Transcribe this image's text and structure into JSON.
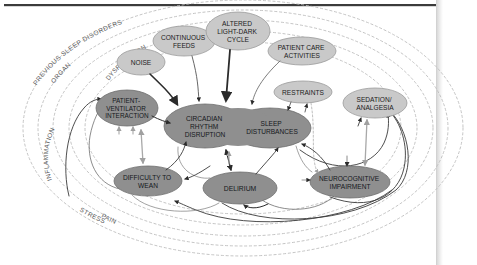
{
  "figure": {
    "type": "causal-loop-diagram",
    "canvas": {
      "width": 477,
      "height": 265
    },
    "colors": {
      "page_background": "#ffffff",
      "top_rule": "#3b3b3b",
      "page_edge": "#e3e3e3",
      "node_light_fill": "#c9c9c9",
      "node_light_stroke": "#9a9a9a",
      "node_dark_fill": "#8f8f8f",
      "node_dark_stroke": "#6f6f6f",
      "arrow_dark": "#2b2b2b",
      "arrow_light": "#a8a8a8",
      "ring_dashed": "#bdbdbd",
      "ring_text": "#5a5a5a",
      "node_text": "#1b1b1b"
    }
  },
  "rings": [
    {
      "id": "ring-previous-sleep-disorders",
      "label": "PREVIOUS SLEEP DISORDERS",
      "index": 0
    },
    {
      "id": "ring-organ-dysfunction",
      "label": "ORGAN     DYSFUNCTION",
      "index": 1
    },
    {
      "id": "ring-inflammation",
      "label": "INFLAMMATION",
      "index": 2
    },
    {
      "id": "ring-stress",
      "label": "STRESS",
      "index": 3
    },
    {
      "id": "ring-pain",
      "label": "PAIN",
      "index": 4
    }
  ],
  "ring_labels": {
    "previous_sleep_disorders": "PREVIOUS SLEEP DISORDERS",
    "organ": "ORGAN",
    "dysfunction": "DYSFUNCTION",
    "inflammation": "INFLAMMATION",
    "stress": "STRESS",
    "pain": "PAIN"
  },
  "nodes": [
    {
      "id": "noise",
      "label": "NOISE",
      "lines": [
        "NOISE"
      ],
      "tone": "light",
      "cx": 141,
      "cy": 62,
      "rx": 24,
      "ry": 13,
      "font_size": 6.6
    },
    {
      "id": "continuous-feeds",
      "label": "CONTINUOUS FEEDS",
      "lines": [
        "CONTINUOUS",
        "FEEDS"
      ],
      "tone": "light",
      "cx": 184,
      "cy": 41,
      "rx": 31,
      "ry": 15,
      "font_size": 6.6
    },
    {
      "id": "altered-light-dark-cycle",
      "label": "ALTERED LIGHT-DARK CYCLE",
      "lines": [
        "ALTERED",
        "LIGHT-DARK",
        "CYCLE"
      ],
      "tone": "light",
      "cx": 238,
      "cy": 31,
      "rx": 32,
      "ry": 19,
      "font_size": 6.6
    },
    {
      "id": "patient-care-activities",
      "label": "PATIENT CARE ACTIVITIES",
      "lines": [
        "PATIENT CARE",
        "ACTIVITIES"
      ],
      "tone": "light",
      "cx": 302,
      "cy": 51,
      "rx": 34,
      "ry": 14,
      "font_size": 6.6
    },
    {
      "id": "restraints",
      "label": "RESTRAINTS",
      "lines": [
        "RESTRAINTS"
      ],
      "tone": "light",
      "cx": 303,
      "cy": 92,
      "rx": 29,
      "ry": 11,
      "font_size": 6.6
    },
    {
      "id": "sedation-analgesia",
      "label": "SEDATION/ ANALGESIA",
      "lines": [
        "SEDATION/",
        "ANALGESIA"
      ],
      "tone": "light",
      "cx": 375,
      "cy": 103,
      "rx": 32,
      "ry": 15,
      "font_size": 6.6
    },
    {
      "id": "patient-ventilator-interaction",
      "label": "PATIENT-VENTILATOR INTERACTION",
      "lines": [
        "PATIENT-",
        "VENTILATOR",
        "INTERACTION"
      ],
      "tone": "dark",
      "cx": 127,
      "cy": 108,
      "rx": 31,
      "ry": 18,
      "font_size": 6.4
    },
    {
      "id": "circadian-rhythm-disruption",
      "label": "CIRCADIAN RHYTHM DISRUPTION",
      "lines": [
        "CIRCADIAN",
        "RHYTHM",
        "DISRUPTION"
      ],
      "tone": "dark",
      "cx": 205,
      "cy": 126,
      "rx": 41,
      "ry": 22,
      "font_size": 6.6
    },
    {
      "id": "sleep-disturbances",
      "label": "SLEEP DISTURBANCES",
      "lines": [
        "SLEEP",
        "DISTURBANCES"
      ],
      "tone": "dark",
      "cx": 270,
      "cy": 128,
      "rx": 41,
      "ry": 20,
      "font_size": 6.6
    },
    {
      "id": "difficulty-to-wean",
      "label": "DIFFICULTY TO WEAN",
      "lines": [
        "DIFFICULTY TO",
        "WEAN"
      ],
      "tone": "dark",
      "cx": 148,
      "cy": 181,
      "rx": 34,
      "ry": 15,
      "font_size": 6.6
    },
    {
      "id": "delirium",
      "label": "DELIRIUM",
      "lines": [
        "DELIRIUM"
      ],
      "tone": "dark",
      "cx": 240,
      "cy": 188,
      "rx": 37,
      "ry": 16,
      "font_size": 6.8
    },
    {
      "id": "neurocognitive-impairment",
      "label": "NEUROCOGNITIVE IMPAIRMENT",
      "lines": [
        "NEUROCOGNITIVE",
        "IMPAIRMENT"
      ],
      "tone": "dark",
      "cx": 350,
      "cy": 182,
      "rx": 40,
      "ry": 16,
      "font_size": 6.6
    }
  ],
  "edges": [
    {
      "from": "noise",
      "to": "circadian-rhythm-disruption",
      "style": "solid-dark"
    },
    {
      "from": "continuous-feeds",
      "to": "circadian-rhythm-disruption",
      "style": "solid-dark"
    },
    {
      "from": "altered-light-dark-cycle",
      "to": "circadian-rhythm-disruption",
      "style": "solid-dark"
    },
    {
      "from": "patient-care-activities",
      "to": "sleep-disturbances",
      "style": "solid-light"
    },
    {
      "from": "restraints",
      "to": "sleep-disturbances",
      "style": "solid-light"
    },
    {
      "from": "patient-ventilator-interaction",
      "to": "circadian-rhythm-disruption",
      "style": "solid-dark"
    },
    {
      "from": "patient-ventilator-interaction",
      "to": "difficulty-to-wean",
      "style": "bidirectional-light"
    },
    {
      "from": "difficulty-to-wean",
      "to": "circadian-rhythm-disruption",
      "style": "solid-dark"
    },
    {
      "from": "circadian-rhythm-disruption",
      "to": "delirium",
      "style": "bidirectional-dark"
    },
    {
      "from": "delirium",
      "to": "sleep-disturbances",
      "style": "solid-dark"
    },
    {
      "from": "delirium",
      "to": "difficulty-to-wean",
      "style": "solid-dark"
    },
    {
      "from": "delirium",
      "to": "neurocognitive-impairment",
      "style": "solid-dark"
    },
    {
      "from": "neurocognitive-impairment",
      "to": "sedation-analgesia",
      "style": "bidirectional-light"
    },
    {
      "from": "sedation-analgesia",
      "to": "sleep-disturbances",
      "style": "solid-dark"
    },
    {
      "from": "sedation-analgesia",
      "to": "delirium",
      "style": "solid-dark"
    },
    {
      "from": "restraints",
      "to": "neurocognitive-impairment",
      "style": "dashed-light"
    }
  ]
}
